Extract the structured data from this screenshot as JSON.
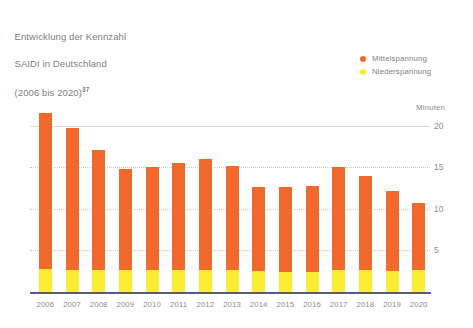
{
  "title": {
    "line1": "Entwicklung der Kennzahl",
    "line2": "SAIDI in Deutschland",
    "line3": "(2006 bis 2020)",
    "footnote": "37"
  },
  "legend": {
    "position": "top-right",
    "items": [
      {
        "label": "Mittelspannung",
        "color": "#f2692c"
      },
      {
        "label": "Niederspannung",
        "color": "#f9ec32"
      }
    ]
  },
  "axis": {
    "unit": "Minuten",
    "yticks": [
      "20",
      "15",
      "10",
      "5"
    ]
  },
  "chart_data": {
    "type": "bar",
    "stacked": true,
    "title": "Entwicklung der Kennzahl SAIDI in Deutschland (2006 bis 2020)",
    "xlabel": "",
    "ylabel": "Minuten",
    "ylim": [
      0,
      22.5
    ],
    "ytick_values": [
      5,
      10,
      15,
      20
    ],
    "grid": true,
    "legend_position": "top-right",
    "categories": [
      "2006",
      "2007",
      "2008",
      "2009",
      "2010",
      "2011",
      "2012",
      "2013",
      "2014",
      "2015",
      "2016",
      "2017",
      "2018",
      "2019",
      "2020"
    ],
    "series": [
      {
        "name": "Mittelspannung",
        "color": "#f2692c",
        "values": [
          18.7,
          17.0,
          14.4,
          12.1,
          12.4,
          12.9,
          13.4,
          12.6,
          10.1,
          10.2,
          10.3,
          12.5,
          11.4,
          9.6,
          8.1
        ]
      },
      {
        "name": "Niederspannung",
        "color": "#f9ec32",
        "values": [
          2.8,
          2.7,
          2.7,
          2.7,
          2.7,
          2.6,
          2.6,
          2.6,
          2.5,
          2.4,
          2.4,
          2.6,
          2.6,
          2.5,
          2.6
        ]
      }
    ],
    "totals": [
      21.5,
      19.7,
      17.1,
      14.8,
      15.1,
      15.5,
      16.0,
      15.2,
      12.6,
      12.6,
      12.7,
      15.1,
      14.0,
      12.1,
      10.7
    ]
  },
  "colors": {
    "mittelspannung": "#f2692c",
    "niederspannung": "#f9ec32",
    "text": "#8a8d91",
    "axis": "#5a5f66",
    "grid": "#d8d8d8"
  }
}
